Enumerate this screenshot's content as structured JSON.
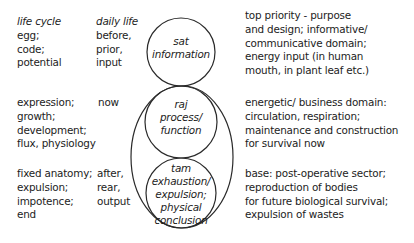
{
  "left_column": {
    "heading": "life cycle",
    "rows": [
      {
        "lines": [
          "egg;",
          "code;",
          "potential"
        ]
      },
      {
        "lines": [
          "expression;",
          "growth;",
          "development;",
          "flux, physiology"
        ]
      },
      {
        "lines": [
          "fixed anatomy;",
          "expulsion;",
          "impotence;",
          "end"
        ]
      }
    ]
  },
  "daily_column": {
    "heading": "daily life",
    "rows": [
      {
        "lines": [
          "before,",
          "prior,",
          "input"
        ]
      },
      {
        "lines": [
          "now"
        ]
      },
      {
        "lines": [
          "after,",
          "rear,",
          "output"
        ]
      }
    ]
  },
  "circles": {
    "top": {
      "lines": [
        "sat",
        "information"
      ]
    },
    "middle": {
      "lines": [
        "raj",
        "process/",
        "function"
      ]
    },
    "bottom": {
      "lines": [
        "tam",
        "exhaustion/",
        "expulsion;",
        "physical",
        "conclusion"
      ]
    }
  },
  "right_column": {
    "rows": [
      {
        "lines": [
          "top priority - purpose",
          "and design; informative/",
          "communicative domain;",
          "energy input (in human",
          "mouth, in plant leaf etc.)"
        ]
      },
      {
        "lines": [
          "energetic/ business domain:",
          "circulation, respiration;",
          "maintenance and construction",
          "for survival now"
        ]
      },
      {
        "lines": [
          "base: post-operative sector;",
          "reproduction of bodies",
          "for future biological survival;",
          "expulsion of wastes"
        ]
      }
    ]
  },
  "colors": {
    "stroke": "#2a2a2a",
    "text": "#1c1c1c",
    "background": "#ffffff"
  }
}
